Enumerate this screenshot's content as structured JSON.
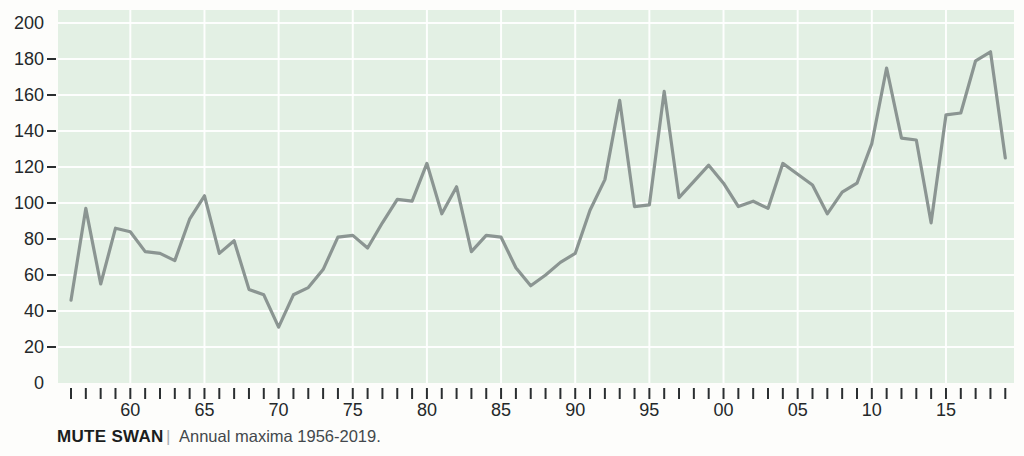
{
  "caption": {
    "title": "MUTE SWAN",
    "separator": "|",
    "subtitle": "Annual maxima 1956-2019."
  },
  "chart_data": {
    "type": "line",
    "title": "MUTE SWAN",
    "caption_separator": "|",
    "subtitle": "Annual maxima 1956-2019.",
    "xlabel": "",
    "ylabel": "",
    "x_range": [
      1956,
      2019
    ],
    "ylim": [
      0,
      200
    ],
    "grid": true,
    "legend": false,
    "x": [
      1956,
      1957,
      1958,
      1959,
      1960,
      1961,
      1962,
      1963,
      1964,
      1965,
      1966,
      1967,
      1968,
      1969,
      1970,
      1971,
      1972,
      1973,
      1974,
      1975,
      1976,
      1977,
      1978,
      1979,
      1980,
      1981,
      1982,
      1983,
      1984,
      1985,
      1986,
      1987,
      1988,
      1989,
      1990,
      1991,
      1992,
      1993,
      1994,
      1995,
      1996,
      1997,
      1998,
      1999,
      2000,
      2001,
      2002,
      2003,
      2004,
      2005,
      2006,
      2007,
      2008,
      2009,
      2010,
      2011,
      2012,
      2013,
      2014,
      2015,
      2016,
      2017,
      2018,
      2019
    ],
    "values": [
      46,
      97,
      55,
      86,
      84,
      73,
      72,
      68,
      91,
      104,
      72,
      79,
      52,
      49,
      31,
      49,
      53,
      63,
      81,
      82,
      75,
      89,
      102,
      101,
      122,
      94,
      109,
      73,
      82,
      81,
      64,
      54,
      60,
      67,
      72,
      96,
      113,
      157,
      98,
      99,
      162,
      103,
      112,
      121,
      111,
      98,
      101,
      97,
      122,
      116,
      110,
      94,
      106,
      111,
      133,
      175,
      136,
      135,
      89,
      149,
      150,
      179,
      184,
      125
    ],
    "yticks": [
      0,
      20,
      40,
      60,
      80,
      100,
      120,
      140,
      160,
      180,
      200
    ],
    "ytick_labels": [
      "0",
      "20",
      "40",
      "60",
      "80",
      "100",
      "120",
      "140",
      "160",
      "180",
      "200"
    ],
    "grid_years": [
      1960,
      1965,
      1970,
      1975,
      1980,
      1985,
      1990,
      1995,
      2000,
      2005,
      2010,
      2015
    ],
    "x_labels": {
      "1960": "60",
      "1965": "65",
      "1970": "70",
      "1975": "75",
      "1980": "80",
      "1985": "85",
      "1990": "90",
      "1995": "95",
      "2000": "00",
      "2005": "05",
      "2010": "10",
      "2015": "15"
    },
    "colors": {
      "plot_bg": "#e3f0e4",
      "grid": "#ffffff",
      "line": "#8b9592",
      "axis_text": "#24282a",
      "tick": "#2a2e30"
    }
  }
}
